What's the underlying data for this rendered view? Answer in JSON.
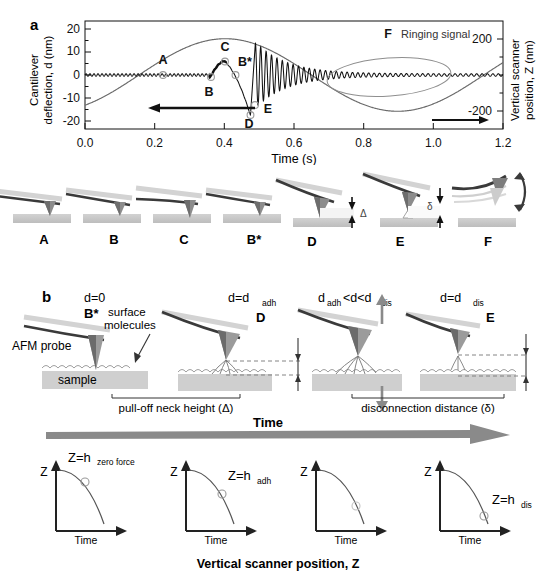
{
  "figure": {
    "panel_a_label": "a",
    "panel_b_label": "b"
  },
  "chart_data": {
    "type": "line",
    "title": "",
    "xlabel": "Time (s)",
    "ylabel_left": "Cantilever deflection, d (nm)",
    "ylabel_right": "Vertical scanner position, Z (nm)",
    "xlim": [
      0.0,
      1.2
    ],
    "ylim_left": [
      -24,
      24
    ],
    "ylim_right": [
      -320,
      320
    ],
    "xticks": [
      "0.0",
      "0.2",
      "0.4",
      "0.6",
      "0.8",
      "1.0",
      "1.2"
    ],
    "xtick_values": [
      0.0,
      0.2,
      0.4,
      0.6,
      0.8,
      1.0,
      1.2
    ],
    "yticks_left": [
      "20",
      "10",
      "0",
      "-10",
      "-20"
    ],
    "ytick_values_left": [
      20,
      10,
      0,
      -10,
      -20
    ],
    "yticks_right": [
      "200",
      "-200"
    ],
    "ytick_values_right": [
      200,
      -200
    ],
    "grid": false,
    "legend": "none",
    "series": [
      {
        "name": "Cantilever deflection, d",
        "axis": "left",
        "color": "#111111",
        "description": "Flat near zero with small ripple until t=0.36 s, rises to peak C (+6 nm) at t=0.40 s, plunges to minimum D (-18 nm) at t=0.475 s, then a damped ringing oscillation decaying from +/-14 nm to near zero by t=0.85 s"
      },
      {
        "name": "Vertical scanner position, Z",
        "axis": "right",
        "color": "#555555",
        "description": "Sinusoid starting at -160 nm at t=0, crossing zero at t=0.155 s, maximum +215 nm at t=0.40 s, crossing zero at t=0.655 s, minimum -215 nm at t=0.90 s, rising back through zero at t=1.155 s"
      }
    ],
    "annotations": [
      {
        "label": "A",
        "x": 0.225,
        "y": 0.0,
        "marker": "open-circle"
      },
      {
        "label": "B",
        "x": 0.362,
        "y": -0.8,
        "marker": "open-circle"
      },
      {
        "label": "C",
        "x": 0.402,
        "y": 6.0,
        "marker": "open-circle"
      },
      {
        "label": "B*",
        "x": 0.432,
        "y": 0.0,
        "marker": "open-circle"
      },
      {
        "label": "D",
        "x": 0.475,
        "y": -18.0,
        "marker": "open-circle"
      },
      {
        "label": "E",
        "x": 0.487,
        "y": -13.5,
        "marker": "open-circle"
      },
      {
        "label": "F",
        "x": 0.64,
        "y": 11.0,
        "marker": "none"
      }
    ],
    "callouts": [
      {
        "name": "ringing-signal",
        "text": "Ringing signal"
      }
    ],
    "axis_arrows": [
      {
        "name": "left-axis-arrow",
        "direction": "left"
      },
      {
        "name": "right-axis-arrow",
        "direction": "right"
      }
    ]
  },
  "schematics_row": {
    "items": [
      {
        "label": "A",
        "name": "schematic-a"
      },
      {
        "label": "B",
        "name": "schematic-b"
      },
      {
        "label": "C",
        "name": "schematic-c"
      },
      {
        "label": "B*",
        "name": "schematic-bstar"
      },
      {
        "label": "D",
        "name": "schematic-d",
        "measure": "Δ"
      },
      {
        "label": "E",
        "name": "schematic-e",
        "measure": "δ"
      },
      {
        "label": "F",
        "name": "schematic-f"
      }
    ]
  },
  "panel_b": {
    "stages": [
      {
        "condition": "d=0",
        "condition_sub": "",
        "point_label": "B*",
        "name": "stage-b-star"
      },
      {
        "condition": "d=d",
        "condition_sub": "adh",
        "point_label": "D",
        "name": "stage-d"
      },
      {
        "condition": "d",
        "condition_sub": "adh",
        "condition_tail": "<d<d",
        "condition_sub2": "dis",
        "point_label": "",
        "name": "stage-between"
      },
      {
        "condition": "d=d",
        "condition_sub": "dis",
        "point_label": "E",
        "name": "stage-e"
      }
    ],
    "labels": {
      "afm_probe": "AFM probe",
      "sample": "sample",
      "surface_molecules_line1": "surface",
      "surface_molecules_line2": "molecules",
      "pull_off": "pull-off neck height (Δ)",
      "disconnection": "disconnection distance (δ)",
      "time_arrow": "Time"
    }
  },
  "mini_plots": {
    "caption": "Vertical scanner position, Z",
    "axis_y": "Z",
    "axis_x": "Time",
    "items": [
      {
        "name": "mini-plot-1",
        "annotation": "Z=h",
        "annotation_sub": "zero force",
        "marker_t": 0.42
      },
      {
        "name": "mini-plot-2",
        "annotation": "Z=h",
        "annotation_sub": "adh",
        "marker_t": 0.55
      },
      {
        "name": "mini-plot-3",
        "annotation": "",
        "annotation_sub": "",
        "marker_t": 0.63
      },
      {
        "name": "mini-plot-4",
        "annotation": "Z=h",
        "annotation_sub": "dis",
        "marker_t": 0.8
      }
    ]
  },
  "colors": {
    "ink": "#111111",
    "gray_curve": "#555555",
    "light_gray": "#b9b9b9",
    "substrate": "#c9c9c9",
    "tip_dark": "#6f6f6f",
    "tip_light": "#cfcfcf"
  }
}
